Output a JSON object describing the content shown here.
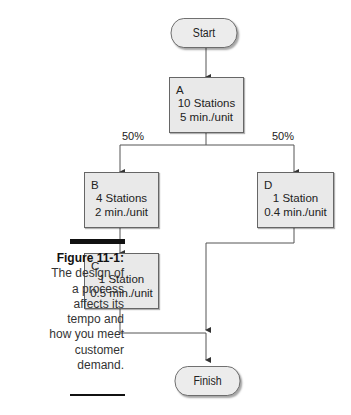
{
  "diagram": {
    "start": {
      "label": "Start"
    },
    "finish": {
      "label": "Finish"
    },
    "nodes": [
      {
        "id": "A",
        "letter": "A",
        "line1": "10 Stations",
        "line2": "5 min./unit"
      },
      {
        "id": "B",
        "letter": "B",
        "line1": "4 Stations",
        "line2": "2 min./unit"
      },
      {
        "id": "C",
        "letter": "C",
        "line1": "1 Station",
        "line2": "0.5 min./unit"
      },
      {
        "id": "D",
        "letter": "D",
        "line1": "1 Station",
        "line2": "0.4 min./unit"
      }
    ],
    "branches": [
      {
        "to": "B",
        "label": "50%"
      },
      {
        "to": "D",
        "label": "50%"
      }
    ],
    "edges": [
      [
        "Start",
        "A"
      ],
      [
        "A",
        "B"
      ],
      [
        "A",
        "D"
      ],
      [
        "B",
        "C"
      ],
      [
        "C",
        "Finish"
      ],
      [
        "D",
        "Finish"
      ]
    ]
  },
  "caption": {
    "title": "Figure 11-1:",
    "text": "The design of a process affects its tempo and how you meet customer demand."
  }
}
